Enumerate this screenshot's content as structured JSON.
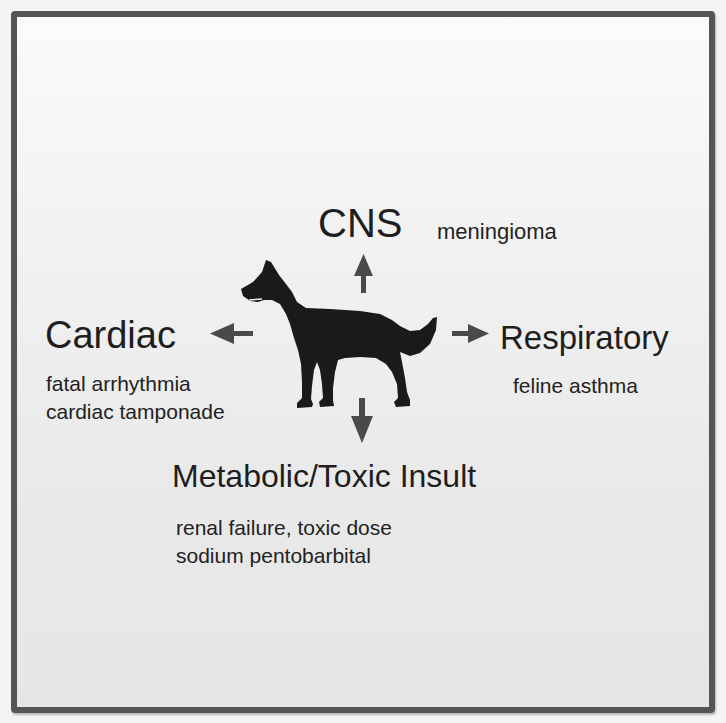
{
  "diagram": {
    "center_icon": "dog-silhouette-icon",
    "colors": {
      "frame": "#555555",
      "arrow": "#4a4a4a",
      "silhouette": "#1a1a1a",
      "text": "#1e1e1e"
    },
    "nodes": {
      "cns": {
        "title": "CNS",
        "items": [
          "meningioma"
        ],
        "direction": "up"
      },
      "cardiac": {
        "title": "Cardiac",
        "items": [
          "fatal arrhythmia",
          "cardiac tamponade"
        ],
        "direction": "left"
      },
      "respiratory": {
        "title": "Respiratory",
        "items": [
          "feline asthma"
        ],
        "direction": "right"
      },
      "metabolic": {
        "title": "Metabolic/Toxic Insult",
        "items": [
          "renal failure, toxic dose",
          "sodium pentobarbital"
        ],
        "direction": "down"
      }
    }
  }
}
